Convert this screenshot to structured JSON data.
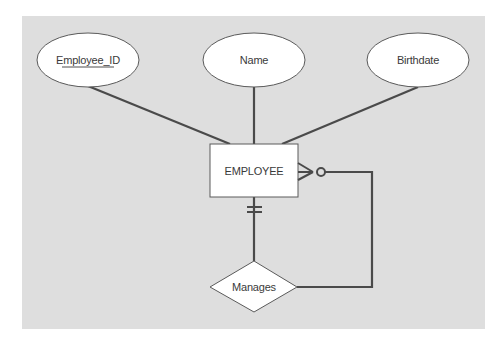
{
  "diagram": {
    "type": "er-diagram",
    "colors": {
      "page_background": "#ffffff",
      "panel_background": "#dedede",
      "shape_fill": "#ffffff",
      "line": "#4a4a4a",
      "text": "#3a3a3a"
    },
    "entity": {
      "label": "EMPLOYEE"
    },
    "attributes": [
      {
        "label": "Employee_ID",
        "primary_key": true
      },
      {
        "label": "Name",
        "primary_key": false
      },
      {
        "label": "Birthdate",
        "primary_key": false
      }
    ],
    "relationship": {
      "label": "Manages",
      "type": "unary",
      "cardinality_entity_side": "mandatory-one",
      "cardinality_recursive_side": "optional-many"
    }
  }
}
